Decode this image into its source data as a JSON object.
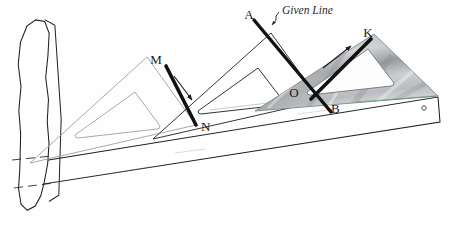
{
  "figure": {
    "background_color": "#fefefe",
    "ink_color": "#1a1a1a",
    "ghost_color": "#9aa0a8",
    "shaded_triangle_color": "#b9bcc0",
    "heavy_line_color": "#111111"
  },
  "labels": {
    "a": "A",
    "given_line": "Given Line",
    "m": "M",
    "n": "N",
    "o": "O",
    "b": "B",
    "k": "K"
  },
  "parts": {
    "tsquare_head": "t-square-head",
    "tsquare_blade": "t-square-blade",
    "blade_hole": "blade-hole",
    "triangle_ghost_left": "triangle-ghost-left",
    "triangle_ghost_middle": "triangle-ghost-middle",
    "triangle_shaded_right": "triangle-shaded-right"
  },
  "annotations": {
    "arrow_mn": "slide-arrow-down-left",
    "arrow_bk": "slide-arrow-up-right",
    "leader_given_line": "given-line-leader"
  },
  "geometry": {
    "segment_mn": {
      "x1": 166,
      "y1": 66,
      "x2": 196,
      "y2": 125
    },
    "segment_ab": {
      "x1": 254,
      "y1": 20,
      "x2": 331,
      "y2": 112
    },
    "segment_bk": {
      "x1": 311,
      "y1": 99,
      "x2": 371,
      "y2": 39
    },
    "blade_top_left": {
      "x": 30,
      "y": 163
    },
    "blade_top_right": {
      "x": 438,
      "y": 97
    },
    "blade_bottom_left": {
      "x": 31,
      "y": 186
    },
    "blade_bottom_right": {
      "x": 440,
      "y": 122
    },
    "blade_hole_center": {
      "x": 424,
      "y": 108,
      "r": 2.2
    }
  }
}
